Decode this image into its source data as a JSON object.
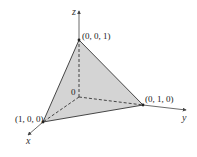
{
  "diagram": {
    "type": "3d-coordinate-tetrahedron",
    "axes": {
      "x_label": "x",
      "y_label": "y",
      "z_label": "z"
    },
    "origin_label": "0",
    "vertices": [
      {
        "label": "(0, 0, 1)",
        "coords": [
          0,
          0,
          1
        ]
      },
      {
        "label": "(0, 1, 0)",
        "coords": [
          0,
          1,
          0
        ]
      },
      {
        "label": "(1, 0, 0)",
        "coords": [
          1,
          0,
          0
        ]
      }
    ],
    "colors": {
      "face_fill": "#d4d4d4",
      "edges": "#333333",
      "axes": "#444444",
      "background": "#ffffff"
    }
  }
}
